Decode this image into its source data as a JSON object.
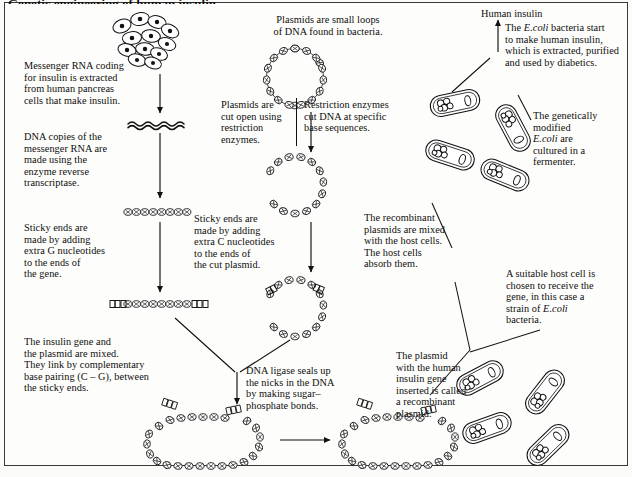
{
  "document": {
    "title": "Genetic engineering of human insulin",
    "frame_color": "#3a3a3a",
    "background": "#fdfdfb",
    "text_color": "#0d0d0d"
  },
  "labels": {
    "human_insulin": "Human insulin"
  },
  "steps": [
    {
      "id": "messenger-rna-extract",
      "text": "Messenger RNA coding\nfor insulin is extracted\nfrom human pancreas\ncells that make insulin.",
      "x": 24,
      "y": 60
    },
    {
      "id": "dna-copies",
      "text": "DNA copies of the\nmessenger RNA are\nmade using the\nenzyme reverse\ntranscriptase.",
      "x": 24,
      "y": 131
    },
    {
      "id": "sticky-ends-gene",
      "text": "Sticky ends are\nmade by adding\nextra G nucleotides\nto the ends of\nthe gene.",
      "x": 24,
      "y": 222
    },
    {
      "id": "insulin-gene-plasmid-mixed",
      "text": "The insulin gene and\nthe plasmid are mixed.\nThey link by complementary\nbase pairing (C – G), between\nthe sticky ends.",
      "x": 24,
      "y": 336
    },
    {
      "id": "plasmids-small-loops",
      "text": "Plasmids are small loops\nof DNA found in bacteria.",
      "x": 243,
      "y": 14
    },
    {
      "id": "plasmids-cut-open",
      "text": "Plasmids are\ncut open using\nrestriction\nenzymes.",
      "x": 221,
      "y": 99
    },
    {
      "id": "restriction-enzymes",
      "text": "Restriction enzymes\ncut DNA at specific\nbase sequences.",
      "x": 286,
      "y": 99
    },
    {
      "id": "sticky-ends-plasmid",
      "text": "Sticky ends are\nmade by adding\nextra C nucleotides\nto the ends of\nthe cut plasmid.",
      "x": 194,
      "y": 213
    },
    {
      "id": "dna-ligase",
      "text": "DNA ligase seals up\nthe nicks in the DNA\nby making sugar–\nphosphate bonds.",
      "x": 246,
      "y": 365
    },
    {
      "id": "recombinant-plasmids-mixed",
      "text": "The recombinant\nplasmids are mixed\nwith the host cells.\nThe host cells\nabsorb them.",
      "x": 364,
      "y": 212
    },
    {
      "id": "plasmid-recombinant-named",
      "text": "The plasmid\nwith the human\ninsulin gene\ninserted is called\na recombinant\nplasmid.",
      "x": 396,
      "y": 350
    },
    {
      "id": "ecoli-make-insulin",
      "text": "The E.coli bacteria start\nto make human insulin,\nwhich is extracted, purified\nand used by diabetics.",
      "x": 500,
      "y": 22
    },
    {
      "id": "genetically-modified-cultured",
      "text": "The genetically\nmodified\nE.coli are\ncultured in a\nfermenter.",
      "x": 533,
      "y": 110
    },
    {
      "id": "suitable-host-cell",
      "text": "A suitable host cell is\nchosen to receive the\ngene, in this case a\nstrain of E.coli\nbacteria.",
      "x": 506,
      "y": 268
    }
  ],
  "figures": [
    {
      "id": "pancreas-cells",
      "kind": "cell-cluster",
      "x": 137,
      "y": 14
    },
    {
      "id": "mrna-strand",
      "kind": "wavy-strand",
      "x": 128,
      "y": 118
    },
    {
      "id": "dna-gene-strand",
      "kind": "beaded-strand",
      "x": 122,
      "y": 208
    },
    {
      "id": "gene-sticky-ends",
      "kind": "beaded-strand-sticky",
      "x": 110,
      "y": 300
    },
    {
      "id": "plasmid-circle",
      "kind": "plasmid-loop",
      "x": 295,
      "y": 75
    },
    {
      "id": "plasmid-cut-open",
      "kind": "plasmid-cut",
      "x": 295,
      "y": 185
    },
    {
      "id": "plasmid-sticky-ends",
      "kind": "plasmid-cut-sticky",
      "x": 290,
      "y": 305
    },
    {
      "id": "recombinant-plasmid-left",
      "kind": "recombinant-plasmid",
      "x": 205,
      "y": 437
    },
    {
      "id": "recombinant-plasmid-right",
      "kind": "recombinant-plasmid",
      "x": 370,
      "y": 437
    },
    {
      "id": "host-bacteria-group",
      "kind": "bacteria-cluster",
      "x": 470,
      "y": 140
    },
    {
      "id": "recipient-bacteria-group",
      "kind": "bacteria-cluster",
      "x": 470,
      "y": 400
    }
  ]
}
